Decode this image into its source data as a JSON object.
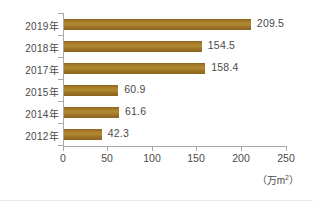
{
  "chart_data": {
    "type": "bar",
    "orientation": "horizontal",
    "title": "",
    "subtitle": "",
    "xlabel": "",
    "ylabel": "",
    "unit_caption": "（万m",
    "unit_exponent": "2",
    "unit_caption_tail": "）",
    "categories": [
      "2019年",
      "2018年",
      "2017年",
      "2015年",
      "2014年",
      "2012年"
    ],
    "values": [
      209.5,
      154.5,
      158.4,
      60.9,
      61.6,
      42.3
    ],
    "value_labels": [
      "209.5",
      "154.5",
      "158.4",
      "60.9",
      "61.6",
      "42.3"
    ],
    "xlim": [
      0,
      250
    ],
    "xticks": [
      0,
      50,
      100,
      150,
      200,
      250
    ],
    "xtick_labels": [
      "0",
      "50",
      "100",
      "150",
      "200",
      "250"
    ],
    "grid": false,
    "legend": false,
    "bar_color": "#a07425",
    "axis_color": "#a8a8a8",
    "text_color": "#4a4a4a",
    "background": "#ffffff"
  }
}
